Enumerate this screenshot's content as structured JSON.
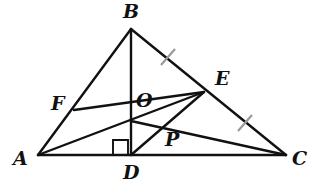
{
  "figure": {
    "kind": "euclidean-geometry-diagram",
    "width": 312,
    "height": 193,
    "background_color": "#ffffff",
    "stroke_color": "#111111",
    "tick_color": "#9a9a9a",
    "stroke_width": 2.4,
    "tick_width": 2.2
  },
  "points": [
    {
      "id": "A",
      "label": "A",
      "x": 38,
      "y": 155,
      "label_x": 13,
      "label_y": 149
    },
    {
      "id": "B",
      "label": "B",
      "x": 131,
      "y": 29,
      "label_x": 123,
      "label_y": 2
    },
    {
      "id": "C",
      "label": "C",
      "x": 286,
      "y": 155,
      "label_x": 292,
      "label_y": 149
    },
    {
      "id": "D",
      "label": "D",
      "x": 131,
      "y": 155,
      "label_x": 123,
      "label_y": 163
    },
    {
      "id": "E",
      "label": "E",
      "x": 204,
      "y": 92,
      "label_x": 215,
      "label_y": 69
    },
    {
      "id": "F",
      "label": "F",
      "x": 74,
      "y": 110,
      "label_x": 51,
      "label_y": 94
    },
    {
      "id": "O",
      "label": "O",
      "x": 131,
      "y": 121,
      "label_x": 136,
      "label_y": 91
    },
    {
      "id": "P",
      "label": "P",
      "x": 165,
      "y": 128,
      "label_x": 165,
      "label_y": 130
    }
  ],
  "segments": [
    {
      "id": "AB",
      "name": "side-ab",
      "x1": 38,
      "y1": 155,
      "x2": 131,
      "y2": 29
    },
    {
      "id": "BC",
      "name": "side-bc",
      "x1": 131,
      "y1": 29,
      "x2": 286,
      "y2": 155
    },
    {
      "id": "AC",
      "name": "side-ac",
      "x1": 38,
      "y1": 155,
      "x2": 286,
      "y2": 155
    },
    {
      "id": "BD",
      "name": "altitude-bd",
      "x1": 131,
      "y1": 29,
      "x2": 131,
      "y2": 155
    },
    {
      "id": "FE",
      "name": "segment-fe",
      "x1": 74,
      "y1": 110,
      "x2": 204,
      "y2": 92
    },
    {
      "id": "AE",
      "name": "segment-ae",
      "x1": 38,
      "y1": 155,
      "x2": 204,
      "y2": 92
    },
    {
      "id": "DE",
      "name": "segment-de",
      "x1": 131,
      "y1": 155,
      "x2": 204,
      "y2": 92
    },
    {
      "id": "OC",
      "name": "segment-oc",
      "x1": 131,
      "y1": 121,
      "x2": 286,
      "y2": 155
    }
  ],
  "tick_marks": [
    {
      "id": "tick-be",
      "name": "congruence-tick-be",
      "x1": 161,
      "y1": 65,
      "x2": 175,
      "y2": 49
    },
    {
      "id": "tick-ec",
      "name": "congruence-tick-ec",
      "x1": 238,
      "y1": 131,
      "x2": 252,
      "y2": 115
    }
  ],
  "right_angle": {
    "id": "right-angle-adb",
    "name": "right-angle-marker-at-d",
    "x": 113,
    "y": 140,
    "size": 15
  }
}
